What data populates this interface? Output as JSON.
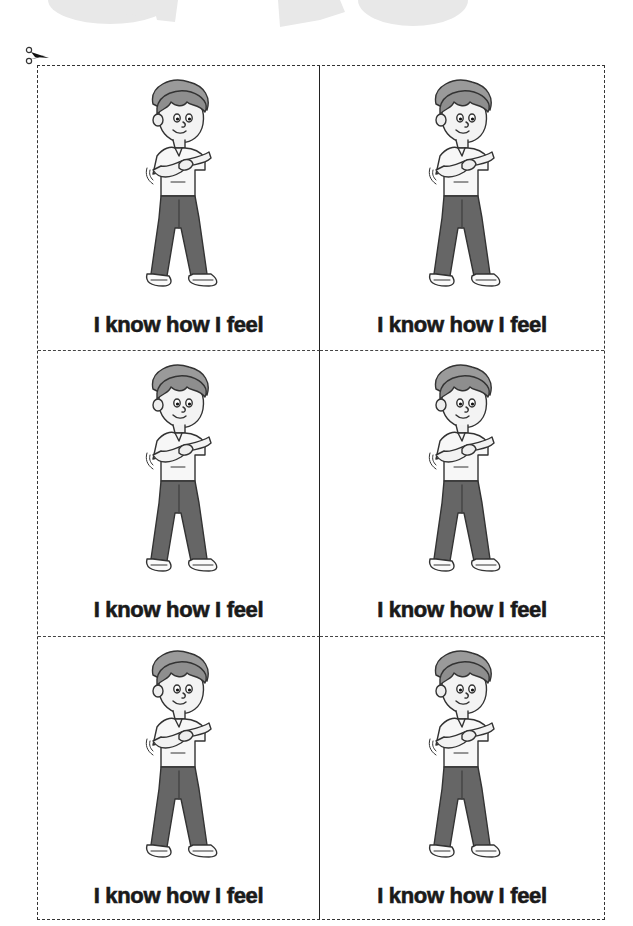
{
  "watermark": {
    "text_fragment": "OM 20",
    "color": "#e6e6e6"
  },
  "cut_line": {
    "icon": "scissors-icon",
    "style": "dashed"
  },
  "cards": [
    {
      "caption": "I know how I feel",
      "illustration": "boy-hands-on-chest"
    },
    {
      "caption": "I know how I feel",
      "illustration": "boy-hands-on-chest"
    },
    {
      "caption": "I know how I feel",
      "illustration": "boy-hands-on-chest"
    },
    {
      "caption": "I know how I feel",
      "illustration": "boy-hands-on-chest"
    },
    {
      "caption": "I know how I feel",
      "illustration": "boy-hands-on-chest"
    },
    {
      "caption": "I know how I feel",
      "illustration": "boy-hands-on-chest"
    }
  ]
}
